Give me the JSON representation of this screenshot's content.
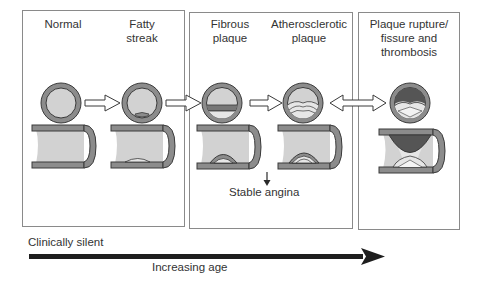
{
  "colors": {
    "wall": "#8c8c8c",
    "wall_stroke": "#3a3a3a",
    "lumen": "#d2d2d2",
    "plaque_light": "#e6e6e6",
    "thrombus": "#555555",
    "box_border": "#8a8a8a",
    "age_arrow": "#1e1e1e"
  },
  "groups": [
    {
      "id": "early",
      "stages": [
        {
          "title_line1": "Normal",
          "title_line2": ""
        },
        {
          "title_line1": "Fatty",
          "title_line2": "streak"
        }
      ]
    },
    {
      "id": "intermediate",
      "stages": [
        {
          "title_line1": "Fibrous",
          "title_line2": "plaque"
        },
        {
          "title_line1": "Atherosclerotic",
          "title_line2": "plaque"
        }
      ],
      "annotation": "Stable angina"
    },
    {
      "id": "complicated",
      "stages": [
        {
          "title_line1": "Plaque rupture/",
          "title_line2": "fissure and",
          "title_line3": "thrombosis"
        }
      ]
    }
  ],
  "timeline": {
    "start_label": "Clinically silent",
    "axis_label": "Increasing age"
  }
}
